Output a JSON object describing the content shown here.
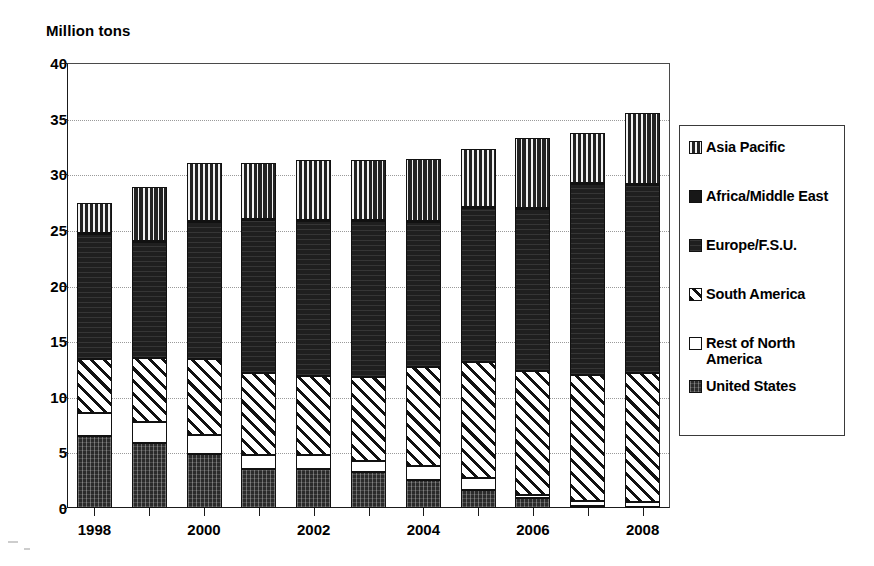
{
  "chart_data": {
    "type": "bar",
    "subtype": "stacked-vertical",
    "title": "",
    "ylabel": "Million tons",
    "xlabel": "",
    "ylim": [
      0,
      40
    ],
    "ytick_step": 5,
    "yticks": [
      "0",
      "5",
      "10",
      "15",
      "20",
      "25",
      "30",
      "35",
      "40"
    ],
    "grid": true,
    "grid_axis": "y",
    "legend_position": "right",
    "categories": [
      "1998",
      "1999",
      "2000",
      "2001",
      "2002",
      "2003",
      "2004",
      "2005",
      "2006",
      "2007",
      "2008"
    ],
    "xtick_labels_shown": [
      "1998",
      "2000",
      "2002",
      "2004",
      "2006",
      "2008"
    ],
    "series": [
      {
        "name": "United States",
        "pattern": "solid-dark",
        "values": [
          6.5,
          5.8,
          4.9,
          3.5,
          3.5,
          3.2,
          2.5,
          1.6,
          0.9,
          0.2,
          0.1
        ]
      },
      {
        "name": "Rest of North America",
        "pattern": "white",
        "values": [
          2.0,
          1.9,
          1.7,
          1.3,
          1.3,
          1.0,
          1.3,
          1.1,
          0.3,
          0.4,
          0.4
        ]
      },
      {
        "name": "South America",
        "pattern": "diagonal-hatch",
        "values": [
          4.9,
          5.8,
          6.8,
          7.3,
          7.1,
          7.6,
          8.9,
          10.4,
          11.1,
          11.4,
          11.6
        ]
      },
      {
        "name": "Europe/F.S.U.",
        "pattern": "dark-fine-horizontal",
        "values": [
          11.2,
          10.4,
          12.3,
          13.8,
          13.9,
          14.0,
          13.0,
          13.9,
          14.6,
          17.1,
          16.9
        ]
      },
      {
        "name": "Africa/Middle East",
        "pattern": "solid-black",
        "values": [
          0.1,
          0.1,
          0.1,
          0.1,
          0.1,
          0.1,
          0.1,
          0.1,
          0.1,
          0.1,
          0.1
        ]
      },
      {
        "name": "Asia Pacific",
        "pattern": "vertical-stripe",
        "values": [
          2.7,
          4.9,
          5.2,
          5.0,
          5.4,
          5.4,
          5.6,
          5.2,
          6.3,
          4.5,
          6.4
        ]
      }
    ],
    "totals": [
      27.4,
      28.9,
      31.0,
      31.0,
      31.3,
      31.3,
      31.4,
      32.3,
      33.3,
      34.7,
      35.5
    ]
  },
  "legend": {
    "items": [
      {
        "label": "Asia Pacific",
        "swatch": "vertical-stripe-swatch"
      },
      {
        "label": "Africa/Middle East",
        "swatch": "solid-black-swatch"
      },
      {
        "label": "Europe/F.S.U.",
        "swatch": "dark-fine-swatch"
      },
      {
        "label": "South America",
        "swatch": "diagonal-hatch-swatch"
      },
      {
        "label": "Rest of North\nAmerica",
        "swatch": "white-swatch"
      },
      {
        "label": "United States",
        "swatch": "solid-dark-swatch"
      }
    ]
  }
}
